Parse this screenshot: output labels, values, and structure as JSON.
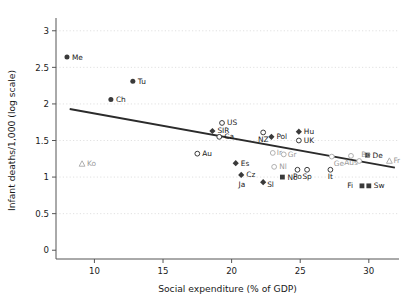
{
  "chart_data": {
    "type": "scatter",
    "title": "",
    "xlabel": "Social expenditure (% of GDP)",
    "ylabel": "Infant deaths/1,000 (log scale)",
    "xlim": [
      7.2,
      32.2
    ],
    "ylim": [
      -0.12,
      3.12
    ],
    "xticks": [
      10,
      15,
      20,
      25,
      30
    ],
    "xtick_labels": [
      "10",
      "15",
      "20",
      "25",
      "30"
    ],
    "yticks": [
      0,
      0.5,
      1,
      1.5,
      2,
      2.5,
      3
    ],
    "ytick_labels": [
      "0",
      "0.5",
      "1",
      "1.5",
      "2",
      "2.5",
      "3"
    ],
    "grid": "horizontal-dotted",
    "legend": "none",
    "points": [
      {
        "label": "Me",
        "x": 8.0,
        "y": 2.64,
        "marker": "filled-circle",
        "lx": 5,
        "ly": 2.5,
        "faint": false
      },
      {
        "label": "Tu",
        "x": 12.8,
        "y": 2.31,
        "marker": "filled-circle",
        "lx": 5,
        "ly": 2.5,
        "faint": false
      },
      {
        "label": "Ch",
        "x": 11.2,
        "y": 2.06,
        "marker": "filled-circle",
        "lx": 5,
        "ly": 2.5,
        "faint": false
      },
      {
        "label": "Ko",
        "x": 9.1,
        "y": 1.18,
        "marker": "open-triangle",
        "lx": 5,
        "ly": 2.5,
        "faint": true
      },
      {
        "label": "US",
        "x": 19.3,
        "y": 1.74,
        "marker": "open-circle",
        "lx": 5,
        "ly": 2.5,
        "faint": false
      },
      {
        "label": "SIR",
        "x": 18.6,
        "y": 1.63,
        "marker": "filled-diamond",
        "lx": 5,
        "ly": 2.5,
        "faint": false
      },
      {
        "label": "Ca",
        "x": 19.1,
        "y": 1.55,
        "marker": "open-circle",
        "lx": 5,
        "ly": 2.5,
        "faint": false
      },
      {
        "label": "NZ",
        "x": 22.3,
        "y": 1.61,
        "marker": "open-circle",
        "lx": 0,
        "ly": 9.5,
        "faint": false
      },
      {
        "label": "Pol",
        "x": 22.9,
        "y": 1.55,
        "marker": "filled-diamond",
        "lx": 5,
        "ly": 2.5,
        "faint": false
      },
      {
        "label": "Hu",
        "x": 24.9,
        "y": 1.62,
        "marker": "filled-diamond",
        "lx": 5,
        "ly": 2.5,
        "faint": false
      },
      {
        "label": "UK",
        "x": 24.9,
        "y": 1.5,
        "marker": "open-circle",
        "lx": 5,
        "ly": 2.5,
        "faint": false
      },
      {
        "label": "Au",
        "x": 17.5,
        "y": 1.32,
        "marker": "open-circle",
        "lx": 5,
        "ly": 2.5,
        "faint": false
      },
      {
        "label": "Ir",
        "x": 23.0,
        "y": 1.33,
        "marker": "open-circle",
        "lx": 4,
        "ly": 2.5,
        "faint": true
      },
      {
        "label": "Gr",
        "x": 23.8,
        "y": 1.31,
        "marker": "open-circle",
        "lx": 4,
        "ly": 2.5,
        "faint": true
      },
      {
        "label": "Ge",
        "x": 27.3,
        "y": 1.28,
        "marker": "open-circle",
        "lx": 2,
        "ly": 9.5,
        "faint": true
      },
      {
        "label": "Aus",
        "x": 28.7,
        "y": 1.29,
        "marker": "open-circle",
        "lx": 0,
        "ly": 9.5,
        "faint": true
      },
      {
        "label": "De",
        "x": 29.9,
        "y": 1.3,
        "marker": "filled-square",
        "lx": 5,
        "ly": 2.5,
        "faint": false
      },
      {
        "label": "Be",
        "x": 29.3,
        "y": 1.22,
        "marker": "open-circle",
        "lx": 2,
        "ly": -4.0,
        "faint": true
      },
      {
        "label": "Fr",
        "x": 31.5,
        "y": 1.22,
        "marker": "open-triangle",
        "lx": 4,
        "ly": 2.5,
        "faint": true
      },
      {
        "label": "Es",
        "x": 20.3,
        "y": 1.19,
        "marker": "filled-diamond",
        "lx": 5,
        "ly": 2.5,
        "faint": false
      },
      {
        "label": "Nl",
        "x": 23.1,
        "y": 1.14,
        "marker": "open-circle",
        "lx": 5,
        "ly": 2.5,
        "faint": true
      },
      {
        "label": "Po",
        "x": 24.8,
        "y": 1.1,
        "marker": "open-circle",
        "lx": 0,
        "ly": 9.5,
        "faint": false
      },
      {
        "label": "Sp",
        "x": 25.5,
        "y": 1.1,
        "marker": "open-circle",
        "lx": 0,
        "ly": 9.5,
        "faint": false
      },
      {
        "label": "It",
        "x": 27.2,
        "y": 1.1,
        "marker": "open-circle",
        "lx": 0,
        "ly": 9.5,
        "faint": false
      },
      {
        "label": "Cz",
        "x": 20.7,
        "y": 1.03,
        "marker": "filled-diamond",
        "lx": 5,
        "ly": 2.5,
        "faint": false
      },
      {
        "label": "No",
        "x": 23.7,
        "y": 1.0,
        "marker": "filled-square",
        "lx": 5,
        "ly": 2.5,
        "faint": false
      },
      {
        "label": "Sl",
        "x": 22.3,
        "y": 0.93,
        "marker": "filled-diamond",
        "lx": 4,
        "ly": 4.5,
        "faint": false
      },
      {
        "label": "Ja",
        "x": 21.8,
        "y": 0.93,
        "marker": "none",
        "lx": -11,
        "ly": 4.5,
        "faint": false
      },
      {
        "label": "Fi",
        "x": 29.5,
        "y": 0.88,
        "marker": "filled-square",
        "lx": -9,
        "ly": 2.5,
        "faint": false
      },
      {
        "label": "Sw",
        "x": 30.0,
        "y": 0.88,
        "marker": "filled-square",
        "lx": 5,
        "ly": 2.5,
        "faint": false
      }
    ],
    "trendline": {
      "x0": 8.2,
      "y0": 1.93,
      "x1": 31.9,
      "y1": 1.13
    }
  }
}
